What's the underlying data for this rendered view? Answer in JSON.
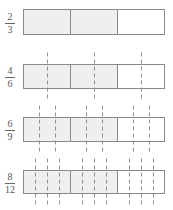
{
  "diagram": {
    "colors": {
      "shaded": "#efefef",
      "unshaded": "#ffffff",
      "border": "#8a8a8a",
      "dash": "#777777"
    },
    "rows": [
      {
        "numerator": "2",
        "denominator": "3",
        "parts_per_third": 1,
        "top": 9,
        "height": 25
      },
      {
        "numerator": "4",
        "denominator": "6",
        "parts_per_third": 2,
        "top": 64,
        "height": 24
      },
      {
        "numerator": "6",
        "denominator": "9",
        "parts_per_third": 3,
        "top": 117,
        "height": 24
      },
      {
        "numerator": "8",
        "denominator": "12",
        "parts_per_third": 4,
        "top": 170,
        "height": 23
      }
    ],
    "shaded_thirds": 2,
    "total_thirds": 3
  }
}
